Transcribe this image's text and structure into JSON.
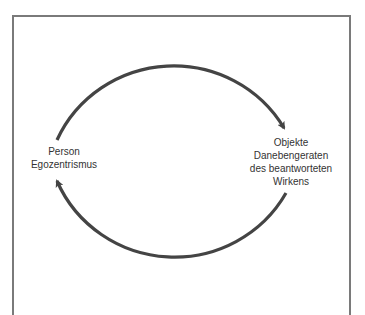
{
  "diagram": {
    "type": "cycle",
    "stroke_color": "#444444",
    "frame_color": "#7a7a7a",
    "nodes": [
      {
        "id": "person",
        "position": "left",
        "lines": [
          "Person",
          "Egozentrismus"
        ]
      },
      {
        "id": "objekte",
        "position": "right",
        "lines": [
          "Objekte",
          "Danebengeraten",
          "des beantworteten",
          "Wirkens"
        ]
      }
    ],
    "edges": [
      {
        "from": "person",
        "to": "objekte",
        "path": "upper-arc",
        "direction": "clockwise"
      },
      {
        "from": "objekte",
        "to": "person",
        "path": "lower-arc",
        "direction": "clockwise"
      }
    ]
  }
}
